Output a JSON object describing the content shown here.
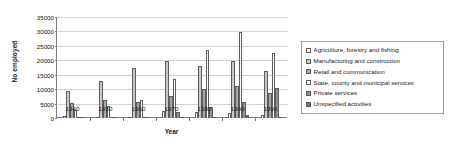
{
  "chart_data": {
    "type": "bar",
    "title": "",
    "xlabel": "Year",
    "ylabel": "No employed",
    "categories": [
      "1940",
      "1950",
      "1960",
      "1970",
      "1980",
      "1990",
      "1996"
    ],
    "ylim": [
      0,
      35000
    ],
    "yticks": [
      0,
      5000,
      10000,
      15000,
      20000,
      25000,
      30000,
      35000
    ],
    "ytick_labels": [
      "0",
      "5000",
      "10000",
      "15000",
      "20000",
      "25000",
      "30000",
      "35000"
    ],
    "grid": true,
    "legend_position": "right",
    "series": [
      {
        "name": "Agriculture, forestry and fishing",
        "color": "#ffffff",
        "values": [
          700,
          500,
          400,
          2300,
          2000,
          1700,
          900
        ]
      },
      {
        "name": "Manufacturing and construction",
        "color": "#c9c9c9",
        "values": [
          9300,
          13000,
          17400,
          19700,
          18000,
          19800,
          16300
        ]
      },
      {
        "name": "Retail and communication",
        "color": "#a6a6a6",
        "values": [
          5100,
          6400,
          5700,
          7500,
          10000,
          11200,
          8700
        ]
      },
      {
        "name": "State, county and municipal services",
        "color": "#ffffff",
        "values": [
          2700,
          4200,
          6300,
          13400,
          23500,
          29900,
          22400
        ]
      },
      {
        "name": "Private services",
        "color": "#8f8f8f",
        "values": [
          300,
          400,
          400,
          2000,
          3900,
          5400,
          10500
        ]
      },
      {
        "name": "Unspecified activities",
        "color": "#6e6e6e",
        "values": [
          100,
          100,
          100,
          100,
          100,
          900,
          400
        ]
      }
    ]
  }
}
